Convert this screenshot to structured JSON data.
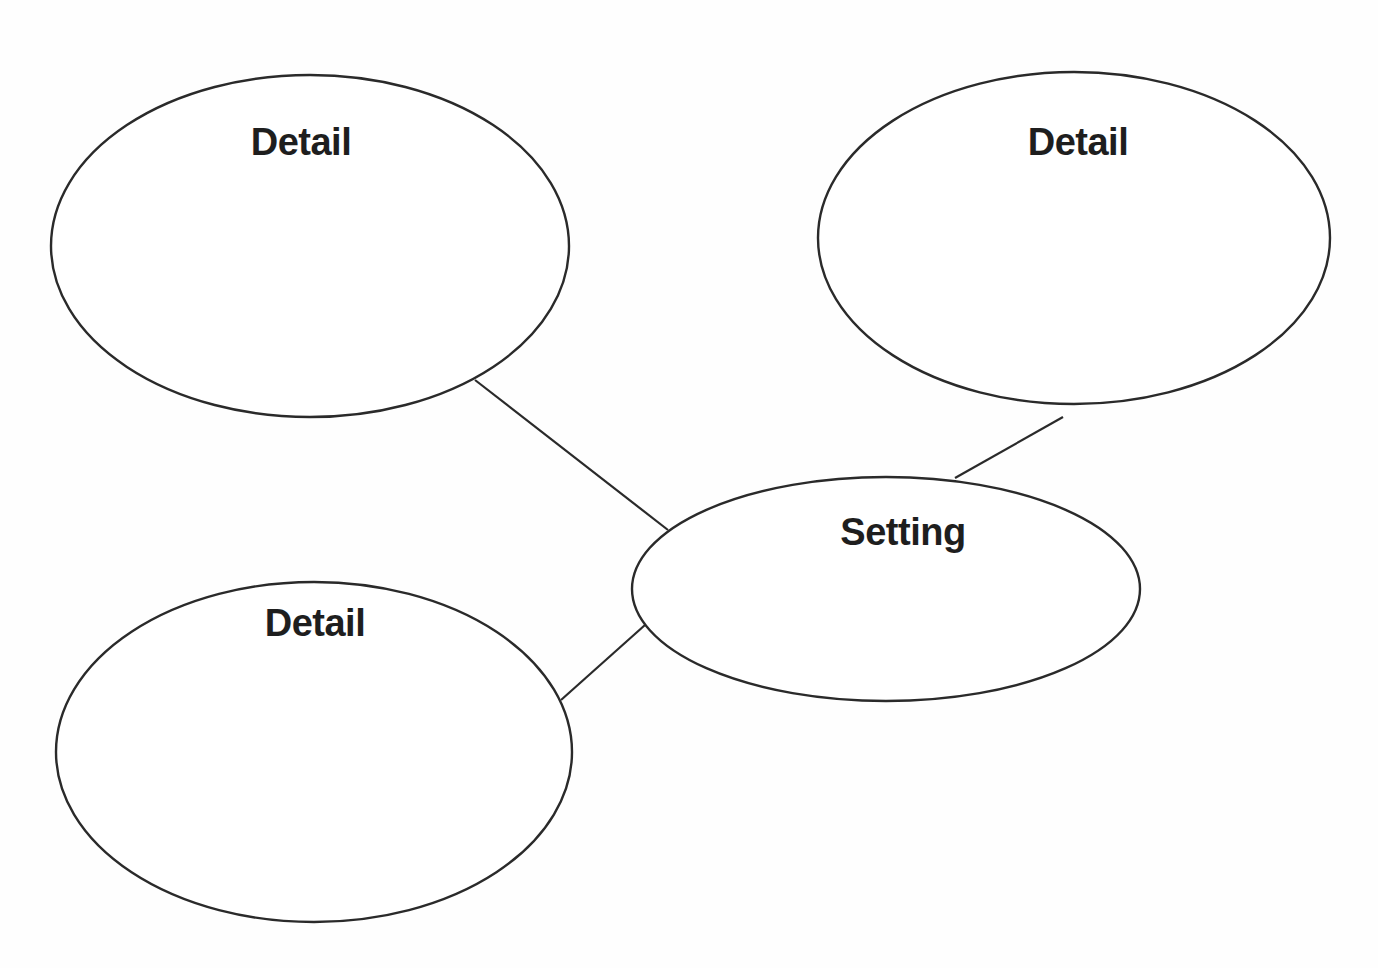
{
  "diagram": {
    "type": "story-map-web",
    "colors": {
      "stroke": "#2a2a2a",
      "text": "#1e1e1e",
      "background": "#fefefe"
    },
    "center_node": {
      "label": "Setting",
      "cx": 886,
      "cy": 589,
      "rx": 254,
      "ry": 112
    },
    "detail_nodes": [
      {
        "label": "Detail",
        "cx": 310,
        "cy": 246,
        "rx": 259,
        "ry": 171
      },
      {
        "label": "Detail",
        "cx": 1074,
        "cy": 238,
        "rx": 256,
        "ry": 166
      },
      {
        "label": "Detail",
        "cx": 314,
        "cy": 752,
        "rx": 258,
        "ry": 170
      }
    ],
    "connectors": [
      {
        "from": "detail-top-left",
        "to": "setting",
        "x1": 475,
        "y1": 380,
        "x2": 668,
        "y2": 530
      },
      {
        "from": "detail-top-right",
        "to": "setting",
        "x1": 1063,
        "y1": 417,
        "x2": 955,
        "y2": 478
      },
      {
        "from": "detail-bottom-left",
        "to": "setting",
        "x1": 561,
        "y1": 700,
        "x2": 645,
        "y2": 625
      }
    ]
  }
}
